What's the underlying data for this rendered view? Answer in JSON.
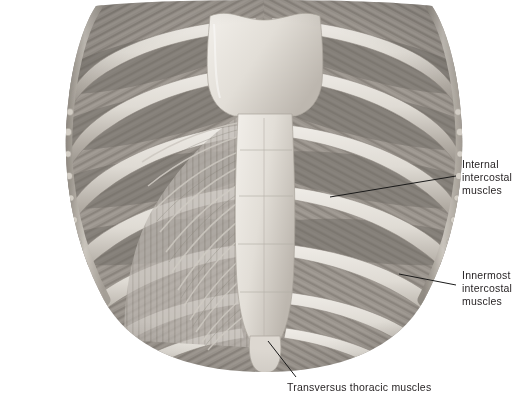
{
  "figure": {
    "view": "internal view of anterior chest wall",
    "background_color": "#ffffff",
    "palette": {
      "bone_light": "#e8e4de",
      "bone_mid": "#cbc6bf",
      "bone_shadow": "#a9a39b",
      "muscle_light": "#c9c4bd",
      "muscle_mid": "#9c968f",
      "muscle_dark": "#6e6a65",
      "cut_edge": "#b8b2aa",
      "leader_line": "#1a1a1a",
      "text": "#231f20"
    },
    "structures": [
      {
        "name": "manubrium",
        "note": "pale broad bone plate at top centre"
      },
      {
        "name": "sternum-body",
        "note": "vertical pale bone below manubrium"
      },
      {
        "name": "xiphoid-process",
        "note": "small rounded pale tip at bottom centre"
      },
      {
        "name": "ribs",
        "count_per_side": 7,
        "note": "pale arching bars sloping down and laterally"
      },
      {
        "name": "intercostal-spaces",
        "note": "darker striated muscle between ribs"
      },
      {
        "name": "transversus-thoracis",
        "note": "fan of fascicles radiating from sternum laterally and upward"
      },
      {
        "name": "cut-edge",
        "note": "rough sawn border along lateral margins"
      }
    ]
  },
  "labels": [
    {
      "id": "internal",
      "text": "Internal\nintercostal\nmuscles",
      "lines": [
        "Internal",
        "intercostal",
        "muscles"
      ],
      "text_x": 462,
      "text_y": 158,
      "leader": {
        "x1": 330,
        "y1": 197,
        "x2": 456,
        "y2": 176
      }
    },
    {
      "id": "innermost",
      "text": "Innermost\nintercostal\nmuscles",
      "lines": [
        "Innermost",
        "intercostal",
        "muscles"
      ],
      "text_x": 462,
      "text_y": 269,
      "leader": {
        "x1": 399,
        "y1": 274,
        "x2": 456,
        "y2": 285
      }
    },
    {
      "id": "transversus",
      "text": "Transversus thoracic muscles",
      "lines": [
        "Transversus thoracic muscles"
      ],
      "text_x": 287,
      "text_y": 381,
      "leader": {
        "x1": 268,
        "y1": 341,
        "x2": 296,
        "y2": 377
      }
    }
  ]
}
